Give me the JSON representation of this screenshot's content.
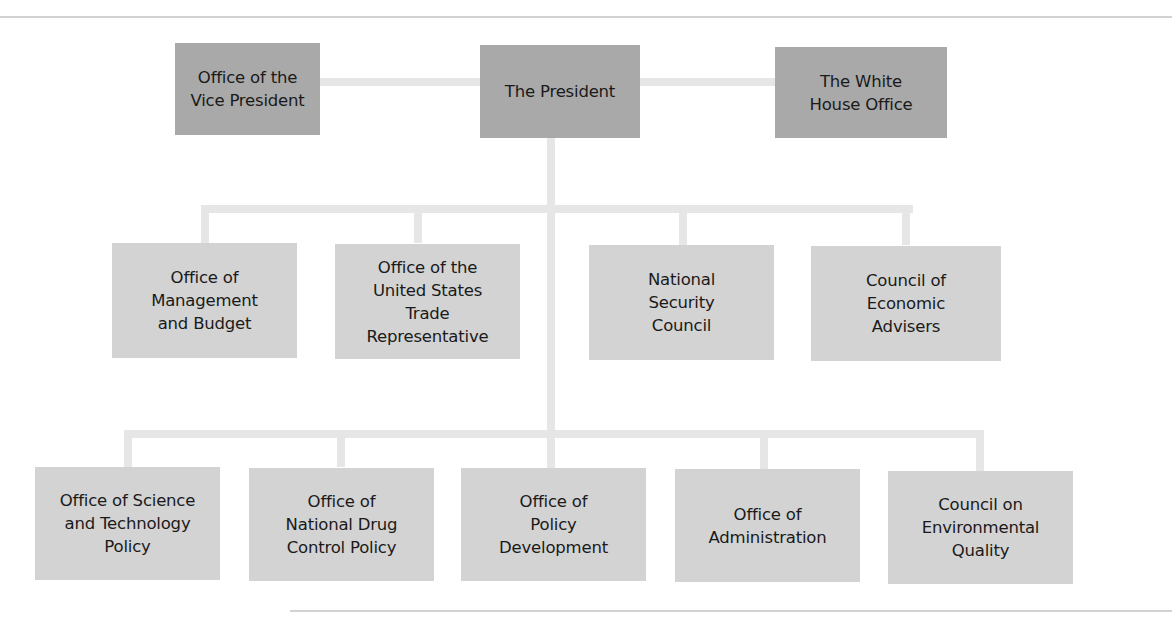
{
  "diagram": {
    "colors": {
      "top_level_box": "#a9a9a9",
      "sub_unit_box": "#d3d3d3",
      "connector": "#e6e6e6",
      "rule": "#d2d2d2"
    },
    "top_row": {
      "vice_president": "Office of the\nVice President",
      "president": "The President",
      "white_house_office": "The White\nHouse Office"
    },
    "second_row": [
      "Office of\nManagement\nand Budget",
      "Office of the\nUnited States\nTrade\nRepresentative",
      "National\nSecurity\nCouncil",
      "Council of\nEconomic\nAdvisers"
    ],
    "third_row": [
      "Office of Science\nand Technology\nPolicy",
      "Office of\nNational Drug\nControl Policy",
      "Office of\nPolicy\nDevelopment",
      "Office of\nAdministration",
      "Council on\nEnvironmental\nQuality"
    ]
  }
}
